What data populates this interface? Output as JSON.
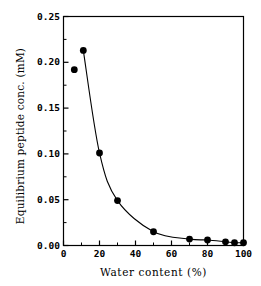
{
  "chart_data": {
    "type": "line",
    "title": "",
    "xlabel": "Water content (%)",
    "ylabel": "Equilibrium peptide conc. (mM)",
    "xlim": [
      0,
      100
    ],
    "ylim": [
      0.0,
      0.25
    ],
    "grid": false,
    "legend": null,
    "marker": "filled-circle",
    "marker_color": "#000000",
    "line_color": "#000000",
    "x": [
      6,
      11,
      20,
      30,
      50,
      70,
      80,
      90,
      95,
      100
    ],
    "values": [
      0.192,
      0.213,
      0.101,
      0.049,
      0.015,
      0.007,
      0.006,
      0.004,
      0.003,
      0.003
    ],
    "points": [
      {
        "x": 6,
        "y": 0.192
      },
      {
        "x": 11,
        "y": 0.213
      },
      {
        "x": 20,
        "y": 0.101
      },
      {
        "x": 30,
        "y": 0.049
      },
      {
        "x": 50,
        "y": 0.015
      },
      {
        "x": 70,
        "y": 0.007
      },
      {
        "x": 80,
        "y": 0.006
      },
      {
        "x": 90,
        "y": 0.004
      },
      {
        "x": 95,
        "y": 0.003
      },
      {
        "x": 100,
        "y": 0.003
      }
    ],
    "xticks": [
      0,
      20,
      40,
      60,
      80,
      100
    ],
    "xtick_labels": [
      "0",
      "20",
      "40",
      "60",
      "80",
      "100"
    ],
    "yticks": [
      0.0,
      0.05,
      0.1,
      0.15,
      0.2,
      0.25
    ],
    "ytick_labels": [
      "0.00",
      "0.05",
      "0.10",
      "0.15",
      "0.20",
      "0.25"
    ],
    "xminor_ticks": [
      10,
      30,
      50,
      70,
      90
    ],
    "yminor_ticks": [
      0.025,
      0.075,
      0.125,
      0.175,
      0.225
    ]
  },
  "axes": {
    "frame_color": "#000000"
  }
}
